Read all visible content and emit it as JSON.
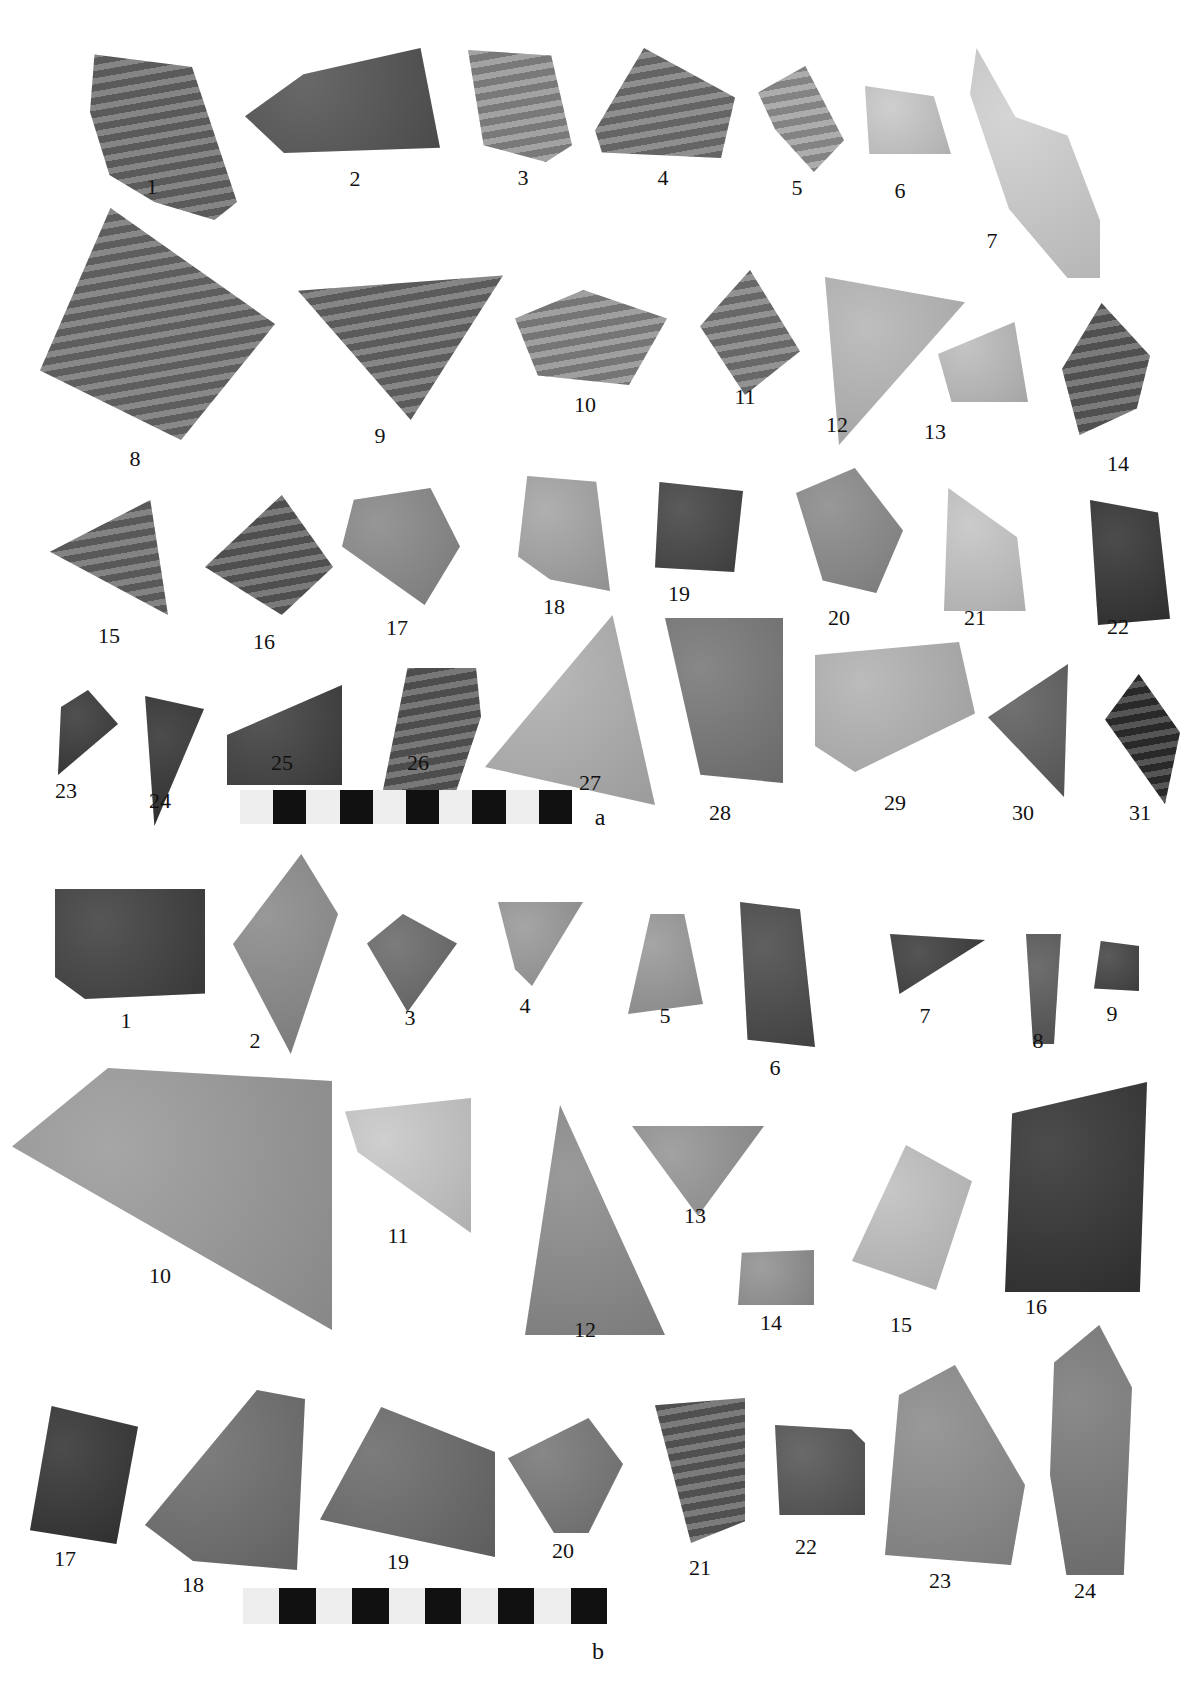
{
  "plate": {
    "panels": [
      {
        "id": "a",
        "label": "a",
        "label_pos": [
          600,
          826
        ],
        "scale_bar": {
          "x": 240,
          "y": 790,
          "w": 332,
          "h": 34,
          "segments": 10
        },
        "sherds": [
          {
            "n": "1",
            "lbl": [
              152,
              196
            ],
            "box": [
              87,
              40,
              150,
              180
            ],
            "fill": "#6a6a6a",
            "stripes": true,
            "poly": "5% 8%, 70% 15%, 100% 90%, 85% 100%, 45% 90%, 15% 75%, 2% 40%"
          },
          {
            "n": "2",
            "lbl": [
              355,
              188
            ],
            "box": [
              245,
              48,
              195,
              105
            ],
            "fill": "#545454",
            "stripes": false,
            "poly": "0% 65%, 30% 25%, 90% 0%, 100% 95%, 20% 100%"
          },
          {
            "n": "3",
            "lbl": [
              523,
              187
            ],
            "box": [
              468,
              50,
              104,
              112
            ],
            "fill": "#8e8e8e",
            "stripes": true,
            "poly": "0% 0%, 80% 5%, 100% 85%, 75% 100%, 15% 85%"
          },
          {
            "n": "4",
            "lbl": [
              663,
              187
            ],
            "box": [
              595,
              48,
              140,
              110
            ],
            "fill": "#767676",
            "stripes": true,
            "poly": "0% 75%, 35% 0%, 100% 45%, 90% 100%, 5% 95%"
          },
          {
            "n": "5",
            "lbl": [
              797,
              197
            ],
            "box": [
              758,
              66,
              86,
              106
            ],
            "fill": "#9a9a9a",
            "stripes": true,
            "poly": "0% 25%, 55% 0%, 100% 70%, 65% 100%, 20% 60%"
          },
          {
            "n": "6",
            "lbl": [
              900,
              200
            ],
            "box": [
              865,
              86,
              86,
              68
            ],
            "fill": "#c8c8c8",
            "stripes": false,
            "poly": "0% 0%, 80% 15%, 100% 100%, 5% 100%"
          },
          {
            "n": "7",
            "lbl": [
              992,
              250
            ],
            "box": [
              970,
              48,
              130,
              230
            ],
            "fill": "#cfcfcf",
            "stripes": false,
            "poly": "5% 0%, 35% 30%, 75% 38%, 100% 75%, 100% 100%, 75% 100%, 30% 70%, 0% 20%"
          },
          {
            "n": "8",
            "lbl": [
              135,
              468
            ],
            "box": [
              40,
              208,
              235,
              232
            ],
            "fill": "#6e6e6e",
            "stripes": true,
            "poly": "30% 0%, 100% 50%, 60% 100%, 0% 70%"
          },
          {
            "n": "9",
            "lbl": [
              380,
              445
            ],
            "box": [
              298,
              268,
              205,
              152
            ],
            "fill": "#6b6b6b",
            "stripes": true,
            "poly": "0% 15%, 100% 5%, 55% 100%"
          },
          {
            "n": "10",
            "lbl": [
              585,
              414
            ],
            "box": [
              515,
              290,
              152,
              95
            ],
            "fill": "#8a8a8a",
            "stripes": true,
            "poly": "0% 30%, 45% 0%, 100% 30%, 75% 100%, 15% 90%"
          },
          {
            "n": "11",
            "lbl": [
              745,
              406
            ],
            "box": [
              700,
              270,
              100,
              125
            ],
            "fill": "#7a7a7a",
            "stripes": true,
            "poly": "0% 45%, 50% 0%, 100% 65%, 45% 100%"
          },
          {
            "n": "12",
            "lbl": [
              837,
              434
            ],
            "box": [
              825,
              277,
              140,
              168
            ],
            "fill": "#b5b5b5",
            "stripes": false,
            "poly": "0% 0%, 100% 15%, 10% 100%"
          },
          {
            "n": "13",
            "lbl": [
              935,
              441
            ],
            "box": [
              938,
              322,
              90,
              80
            ],
            "fill": "#bcbcbc",
            "stripes": false,
            "poly": "0% 40%, 85% 0%, 100% 100%, 15% 100%"
          },
          {
            "n": "14",
            "lbl": [
              1118,
              473
            ],
            "box": [
              1062,
              303,
              88,
              132
            ],
            "fill": "#5e5e5e",
            "stripes": true,
            "poly": "45% 0%, 100% 40%, 85% 80%, 20% 100%, 0% 50%"
          },
          {
            "n": "15",
            "lbl": [
              109,
              645
            ],
            "box": [
              50,
              500,
              118,
              115
            ],
            "fill": "#686868",
            "stripes": true,
            "poly": "0% 45%, 85% 0%, 100% 100%"
          },
          {
            "n": "16",
            "lbl": [
              264,
              651
            ],
            "box": [
              205,
              495,
              128,
              120
            ],
            "fill": "#5d5d5d",
            "stripes": true,
            "poly": "0% 60%, 60% 0%, 100% 60%, 60% 100%"
          },
          {
            "n": "17",
            "lbl": [
              397,
              637
            ],
            "box": [
              342,
              488,
              118,
              117
            ],
            "fill": "#888",
            "stripes": false,
            "poly": "10% 10%, 75% 0%, 100% 50%, 70% 100%, 0% 50%"
          },
          {
            "n": "18",
            "lbl": [
              554,
              616
            ],
            "box": [
              518,
              476,
              92,
              115
            ],
            "fill": "#a4a4a4",
            "stripes": false,
            "poly": "10% 0%, 85% 5%, 100% 100%, 35% 90%, 0% 70%"
          },
          {
            "n": "19",
            "lbl": [
              679,
              603
            ],
            "box": [
              655,
              482,
              88,
              90
            ],
            "fill": "#444",
            "stripes": false,
            "poly": "5% 0%, 100% 10%, 90% 100%, 0% 95%"
          },
          {
            "n": "20",
            "lbl": [
              839,
              627
            ],
            "box": [
              796,
              468,
              107,
              125
            ],
            "fill": "#8a8a8a",
            "stripes": false,
            "poly": "0% 20%, 55% 0%, 100% 50%, 75% 100%, 25% 90%"
          },
          {
            "n": "21",
            "lbl": [
              975,
              627
            ],
            "box": [
              944,
              488,
              86,
              123
            ],
            "fill": "#c4c4c4",
            "stripes": false,
            "poly": "5% 0%, 85% 40%, 95% 100%, 0% 100%"
          },
          {
            "n": "22",
            "lbl": [
              1118,
              636
            ],
            "box": [
              1090,
              500,
              80,
              125
            ],
            "fill": "#333",
            "stripes": false,
            "poly": "0% 0%, 85% 10%, 100% 95%, 10% 100%"
          },
          {
            "n": "23",
            "lbl": [
              66,
              800
            ],
            "box": [
              58,
              690,
              60,
              85
            ],
            "fill": "#383838",
            "stripes": false,
            "poly": "50% 0%, 100% 40%, 0% 100%, 5% 20%"
          },
          {
            "n": "24",
            "lbl": [
              160,
              810
            ],
            "box": [
              142,
              696,
              62,
              130
            ],
            "fill": "#333",
            "stripes": false,
            "poly": "5% 0%, 100% 10%, 20% 100%"
          },
          {
            "n": "25",
            "lbl": [
              282,
              772
            ],
            "box": [
              227,
              685,
              115,
              100
            ],
            "fill": "#404040",
            "stripes": false,
            "poly": "0% 50%, 100% 0%, 100% 100%, 0% 100%"
          },
          {
            "n": "26",
            "lbl": [
              418,
              772
            ],
            "box": [
              383,
              668,
              98,
              122
            ],
            "fill": "#5a5a5a",
            "stripes": true,
            "poly": "25% 0%, 95% 0%, 100% 40%, 75% 100%, 0% 100%"
          },
          {
            "n": "27",
            "lbl": [
              590,
              792
            ],
            "box": [
              485,
              615,
              170,
              190
            ],
            "fill": "#b0b0b0",
            "stripes": false,
            "poly": "75% 0%, 100% 100%, 0% 80%"
          },
          {
            "n": "28",
            "lbl": [
              720,
              822
            ],
            "box": [
              665,
              618,
              118,
              165
            ],
            "fill": "#777",
            "stripes": false,
            "poly": "0% 0%, 100% 0%, 100% 100%, 30% 95%"
          },
          {
            "n": "29",
            "lbl": [
              895,
              812
            ],
            "box": [
              815,
              642,
              160,
              130
            ],
            "fill": "#b2b2b2",
            "stripes": false,
            "poly": "0% 10%, 90% 0%, 100% 55%, 25% 100%, 0% 80%"
          },
          {
            "n": "30",
            "lbl": [
              1023,
              822
            ],
            "box": [
              988,
              664,
              80,
              133
            ],
            "fill": "#5e5e5e",
            "stripes": false,
            "poly": "0% 40%, 100% 0%, 95% 100%"
          },
          {
            "n": "31",
            "lbl": [
              1140,
              822
            ],
            "box": [
              1105,
              674,
              75,
              130
            ],
            "fill": "#303030",
            "stripes": true,
            "poly": "45% 0%, 100% 45%, 80% 100%, 0% 35%"
          }
        ]
      },
      {
        "id": "b",
        "label": "b",
        "label_pos": [
          598,
          1660
        ],
        "scale_bar": {
          "x": 243,
          "y": 1588,
          "w": 364,
          "h": 36,
          "segments": 10
        },
        "sherds": [
          {
            "n": "1",
            "lbl": [
              126,
              1030
            ],
            "box": [
              55,
              889,
              150,
              110
            ],
            "fill": "#3f3f3f",
            "stripes": false,
            "poly": "0% 0%, 100% 0%, 100% 95%, 20% 100%, 0% 80%"
          },
          {
            "n": "2",
            "lbl": [
              255,
              1050
            ],
            "box": [
              233,
              854,
              105,
              200
            ],
            "fill": "#8a8a8a",
            "stripes": false,
            "poly": "65% 0%, 100% 30%, 55% 100%, 0% 45%"
          },
          {
            "n": "3",
            "lbl": [
              410,
              1027
            ],
            "box": [
              367,
              914,
              90,
              98
            ],
            "fill": "#6a6a6a",
            "stripes": false,
            "poly": "0% 30%, 40% 0%, 100% 30%, 45% 100%"
          },
          {
            "n": "4",
            "lbl": [
              525,
              1015
            ],
            "box": [
              498,
              902,
              85,
              84
            ],
            "fill": "#999",
            "stripes": false,
            "poly": "0% 0%, 100% 0%, 40% 100%, 20% 80%"
          },
          {
            "n": "5",
            "lbl": [
              665,
              1025
            ],
            "box": [
              628,
              914,
              75,
              100
            ],
            "fill": "#999",
            "stripes": false,
            "poly": "30% 0%, 75% 0%, 100% 90%, 0% 100%"
          },
          {
            "n": "6",
            "lbl": [
              775,
              1077
            ],
            "box": [
              740,
              902,
              75,
              145
            ],
            "fill": "#4a4a4a",
            "stripes": false,
            "poly": "0% 0%, 80% 5%, 100% 100%, 10% 95%"
          },
          {
            "n": "7",
            "lbl": [
              925,
              1025
            ],
            "box": [
              890,
              934,
              95,
              60
            ],
            "fill": "#3d3d3d",
            "stripes": false,
            "poly": "0% 0%, 100% 10%, 10% 100%"
          },
          {
            "n": "8",
            "lbl": [
              1038,
              1050
            ],
            "box": [
              1026,
              934,
              35,
              110
            ],
            "fill": "#5a5a5a",
            "stripes": false,
            "poly": "0% 0%, 100% 0%, 80% 100%, 20% 100%"
          },
          {
            "n": "9",
            "lbl": [
              1112,
              1023
            ],
            "box": [
              1094,
              941,
              45,
              50
            ],
            "fill": "#444",
            "stripes": false,
            "poly": "15% 0%, 100% 10%, 100% 100%, 0% 95%"
          },
          {
            "n": "10",
            "lbl": [
              160,
              1285
            ],
            "box": [
              12,
              1068,
              320,
              262
            ],
            "fill": "#9a9a9a",
            "stripes": false,
            "poly": "30% 0%, 100% 5%, 100% 100%, 0% 30%"
          },
          {
            "n": "11",
            "lbl": [
              398,
              1245
            ],
            "box": [
              345,
              1098,
              126,
              135
            ],
            "fill": "#c8c8c8",
            "stripes": false,
            "poly": "0% 10%, 100% 0%, 100% 100%, 10% 40%"
          },
          {
            "n": "12",
            "lbl": [
              585,
              1339
            ],
            "box": [
              525,
              1105,
              140,
              230
            ],
            "fill": "#8c8c8c",
            "stripes": false,
            "poly": "25% 0%, 100% 100%, 0% 100%"
          },
          {
            "n": "13",
            "lbl": [
              695,
              1225
            ],
            "box": [
              632,
              1126,
              132,
              90
            ],
            "fill": "#959595",
            "stripes": false,
            "poly": "0% 0%, 100% 0%, 50% 100%"
          },
          {
            "n": "14",
            "lbl": [
              771,
              1332
            ],
            "box": [
              738,
              1250,
              76,
              55
            ],
            "fill": "#929292",
            "stripes": false,
            "poly": "5% 5%, 100% 0%, 100% 100%, 0% 100%"
          },
          {
            "n": "15",
            "lbl": [
              901,
              1334
            ],
            "box": [
              852,
              1145,
              120,
              145
            ],
            "fill": "#bfbfbf",
            "stripes": false,
            "poly": "45% 0%, 100% 25%, 70% 100%, 0% 80%"
          },
          {
            "n": "16",
            "lbl": [
              1036,
              1316
            ],
            "box": [
              1005,
              1082,
              142,
              210
            ],
            "fill": "#333",
            "stripes": false,
            "poly": "5% 15%, 100% 0%, 95% 100%, 0% 100%"
          },
          {
            "n": "17",
            "lbl": [
              65,
              1568
            ],
            "box": [
              30,
              1406,
              108,
              138
            ],
            "fill": "#333",
            "stripes": false,
            "poly": "20% 0%, 100% 15%, 80% 100%, 0% 90%"
          },
          {
            "n": "18",
            "lbl": [
              193,
              1594
            ],
            "box": [
              145,
              1390,
              160,
              180
            ],
            "fill": "#6e6e6e",
            "stripes": false,
            "poly": "70% 0%, 100% 5%, 95% 100%, 30% 95%, 0% 75%"
          },
          {
            "n": "19",
            "lbl": [
              398,
              1571
            ],
            "box": [
              320,
              1407,
              175,
              150
            ],
            "fill": "#6a6a6a",
            "stripes": false,
            "poly": "35% 0%, 100% 30%, 100% 100%, 0% 75%"
          },
          {
            "n": "20",
            "lbl": [
              563,
              1560
            ],
            "box": [
              508,
              1418,
              115,
              115
            ],
            "fill": "#777",
            "stripes": false,
            "poly": "0% 35%, 70% 0%, 100% 40%, 70% 100%, 40% 100%"
          },
          {
            "n": "21",
            "lbl": [
              700,
              1577
            ],
            "box": [
              655,
              1398,
              90,
              145
            ],
            "fill": "#5e5e5e",
            "stripes": true,
            "poly": "0% 5%, 100% 0%, 100% 85%, 40% 100%"
          },
          {
            "n": "22",
            "lbl": [
              806,
              1556
            ],
            "box": [
              775,
              1425,
              90,
              90
            ],
            "fill": "#555",
            "stripes": false,
            "poly": "0% 0%, 85% 5%, 100% 20%, 100% 100%, 5% 100%"
          },
          {
            "n": "23",
            "lbl": [
              940,
              1590
            ],
            "box": [
              885,
              1365,
              140,
              200
            ],
            "fill": "#8b8b8b",
            "stripes": false,
            "poly": "10% 15%, 50% 0%, 100% 60%, 90% 100%, 0% 95%"
          },
          {
            "n": "24",
            "lbl": [
              1085,
              1600
            ],
            "box": [
              1050,
              1325,
              82,
              250
            ],
            "fill": "#7a7a7a",
            "stripes": false,
            "poly": "60% 0%, 100% 25%, 90% 100%, 20% 100%, 0% 60%, 5% 15%"
          }
        ]
      }
    ]
  }
}
